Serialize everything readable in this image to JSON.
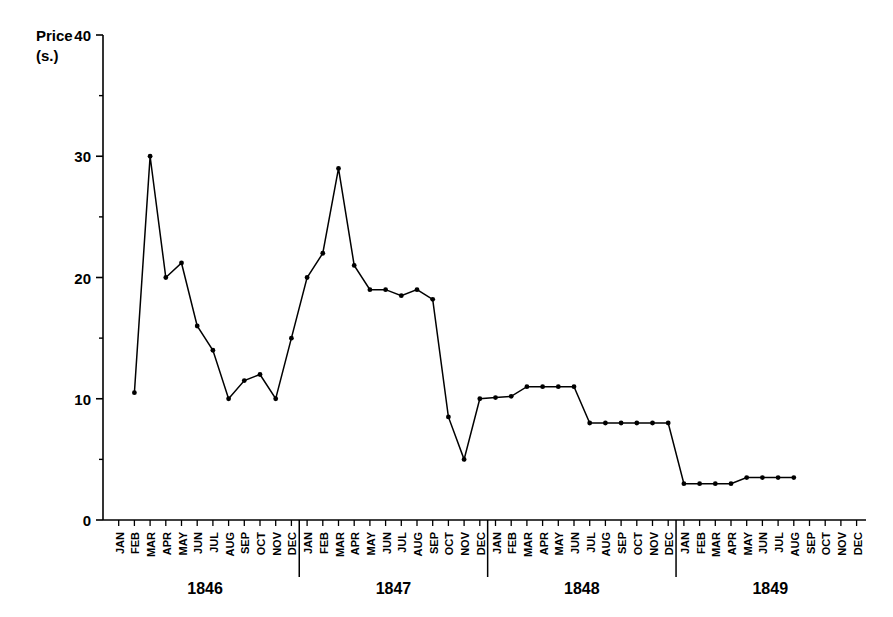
{
  "chart_data": {
    "type": "line",
    "title": "",
    "subtitle": "",
    "xlabel": "",
    "ylabel": "Price (s.)",
    "ylabel_line1": "Price",
    "ylabel_line2": "(s.)",
    "ylim": [
      0,
      40
    ],
    "yticks": [
      0,
      10,
      20,
      30,
      40
    ],
    "ytick_labels": [
      "0",
      "10",
      "20",
      "30",
      "40"
    ],
    "yminor_ticks": [
      5,
      15,
      25,
      35
    ],
    "grid": false,
    "legend": "none",
    "marker": "filled-circle",
    "line_color": "#000000",
    "months": [
      "JAN",
      "FEB",
      "MAR",
      "APR",
      "MAY",
      "JUN",
      "JUL",
      "AUG",
      "SEP",
      "OCT",
      "NOV",
      "DEC"
    ],
    "years": [
      "1846",
      "1847",
      "1848",
      "1849"
    ],
    "categories": [
      "JAN 1846",
      "FEB 1846",
      "MAR 1846",
      "APR 1846",
      "MAY 1846",
      "JUN 1846",
      "JUL 1846",
      "AUG 1846",
      "SEP 1846",
      "OCT 1846",
      "NOV 1846",
      "DEC 1846",
      "JAN 1847",
      "FEB 1847",
      "MAR 1847",
      "APR 1847",
      "MAY 1847",
      "JUN 1847",
      "JUL 1847",
      "AUG 1847",
      "SEP 1847",
      "OCT 1847",
      "NOV 1847",
      "DEC 1847",
      "JAN 1848",
      "FEB 1848",
      "MAR 1848",
      "APR 1848",
      "MAY 1848",
      "JUN 1848",
      "JUL 1848",
      "AUG 1848",
      "SEP 1848",
      "OCT 1848",
      "NOV 1848",
      "DEC 1848",
      "JAN 1849",
      "FEB 1849",
      "MAR 1849",
      "APR 1849",
      "MAY 1849",
      "JUN 1849",
      "JUL 1849",
      "AUG 1849",
      "SEP 1849",
      "OCT 1849",
      "NOV 1849",
      "DEC 1849"
    ],
    "values": [
      null,
      10.5,
      30.0,
      20.0,
      21.2,
      16.0,
      14.0,
      10.0,
      11.5,
      12.0,
      10.0,
      15.0,
      20.0,
      22.0,
      29.0,
      21.0,
      19.0,
      19.0,
      18.5,
      19.0,
      18.2,
      8.5,
      5.0,
      10.0,
      10.1,
      10.2,
      11.0,
      11.0,
      11.0,
      11.0,
      8.0,
      8.0,
      8.0,
      8.0,
      8.0,
      8.0,
      3.0,
      3.0,
      3.0,
      3.0,
      3.5,
      3.5,
      3.5,
      3.5,
      null,
      null,
      null,
      null
    ],
    "series": [
      {
        "name": "Price (s.)",
        "values": [
          null,
          10.5,
          30.0,
          20.0,
          21.2,
          16.0,
          14.0,
          10.0,
          11.5,
          12.0,
          10.0,
          15.0,
          20.0,
          22.0,
          29.0,
          21.0,
          19.0,
          19.0,
          18.5,
          19.0,
          18.2,
          8.5,
          5.0,
          10.0,
          10.1,
          10.2,
          11.0,
          11.0,
          11.0,
          11.0,
          8.0,
          8.0,
          8.0,
          8.0,
          8.0,
          8.0,
          3.0,
          3.0,
          3.0,
          3.0,
          3.5,
          3.5,
          3.5,
          3.5,
          null,
          null,
          null,
          null
        ]
      }
    ]
  }
}
